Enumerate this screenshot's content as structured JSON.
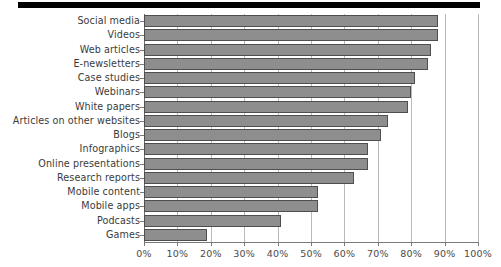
{
  "chart": {
    "type": "bar",
    "title": "",
    "subtitle": "",
    "xlabel": "",
    "ylabel": "",
    "orientation": "horizontal"
  },
  "chart_data": {
    "type": "bar",
    "orientation": "horizontal",
    "title": "",
    "subtitle": "",
    "xlabel": "",
    "ylabel": "",
    "xlim": [
      0,
      100
    ],
    "ylim": null,
    "grid": "vertical",
    "legend": null,
    "legend_position": "none",
    "units": "percent",
    "categories": [
      "Social media",
      "Videos",
      "Web articles",
      "E-newsletters",
      "Case studies",
      "Webinars",
      "White papers",
      "Articles on other websites",
      "Blogs",
      "Infographics",
      "Online presentations",
      "Research reports",
      "Mobile content",
      "Mobile apps",
      "Podcasts",
      "Games"
    ],
    "values": [
      88,
      88,
      86,
      85,
      81,
      80,
      79,
      73,
      71,
      67,
      67,
      63,
      52,
      52,
      41,
      19
    ],
    "series": [
      {
        "name": "Usage",
        "values": [
          88,
          88,
          86,
          85,
          81,
          80,
          79,
          73,
          71,
          67,
          67,
          63,
          52,
          52,
          41,
          19
        ]
      }
    ],
    "xticks": [
      0,
      10,
      20,
      30,
      40,
      50,
      60,
      70,
      80,
      90,
      100
    ],
    "xticklabels": [
      "0%",
      "10%",
      "20%",
      "30%",
      "40%",
      "50%",
      "60%",
      "70%",
      "80%",
      "90%",
      "100%"
    ],
    "annotations": []
  },
  "style": {
    "bar_fill": "#8e8e8e",
    "bar_border": "#4f4f4f",
    "gridline_color": "#b9b9b9",
    "axis_color": "#7a7a7a",
    "label_color": "#3b3b3b",
    "tick_label_color": "#4a4a4a",
    "top_rule_color": "#000000",
    "background": "#ffffff"
  }
}
